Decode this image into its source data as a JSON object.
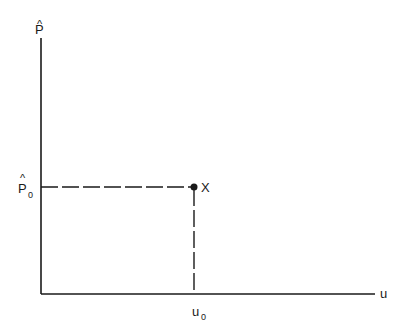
{
  "diagram": {
    "axes": {
      "y_label": "P",
      "y_label_hat": "^",
      "x_label": "u",
      "color": "#1a1a1a"
    },
    "point": {
      "label": "X",
      "x_tick_label": "u",
      "x_tick_sub": "0",
      "y_tick_label": "P",
      "y_tick_hat": "^",
      "y_tick_sub": "0"
    }
  }
}
